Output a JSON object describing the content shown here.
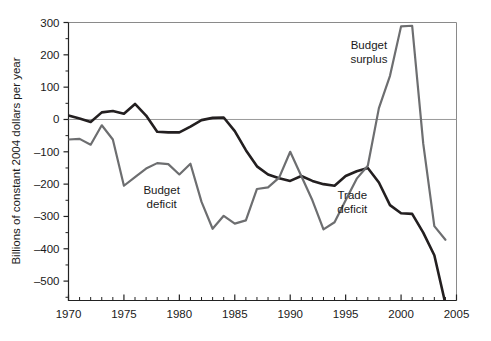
{
  "chart_data": {
    "type": "line",
    "title": "",
    "xlabel": "",
    "ylabel": "Billions of constant 2004 dollars per year",
    "xlim": [
      1970,
      2005
    ],
    "ylim": [
      -560,
      300
    ],
    "grid": false,
    "zero_line": true,
    "legend_position": "inline-annotations",
    "x_ticks_major": [
      1970,
      1975,
      1980,
      1985,
      1990,
      1995,
      2000,
      2005
    ],
    "x_tick_labels": [
      "1970",
      "1975",
      "1980",
      "1985",
      "1990",
      "1995",
      "2000",
      "2005"
    ],
    "x_minor_tick_interval": 1,
    "y_ticks_major": [
      300,
      200,
      100,
      0,
      -100,
      -200,
      -300,
      -400,
      -500
    ],
    "y_tick_labels": [
      "300",
      "200",
      "100",
      "0",
      "-100",
      "-200",
      "-300",
      "-400",
      "-500"
    ],
    "y_minor_tick_interval": 50,
    "annotations": [
      {
        "text_line1": "Budget",
        "text_line2": "surplus",
        "x": 1997.1,
        "y": 218
      },
      {
        "text_line1": "Budget",
        "text_line2": "deficit",
        "x": 1978.4,
        "y": -231
      },
      {
        "text_line1": "Trade",
        "text_line2": "deficit",
        "x": 1995.6,
        "y": -246
      }
    ],
    "series": [
      {
        "name": "Trade deficit",
        "color": "#231f20",
        "x": [
          1970,
          1971,
          1972,
          1973,
          1974,
          1975,
          1976,
          1977,
          1978,
          1979,
          1980,
          1981,
          1982,
          1983,
          1984,
          1985,
          1986,
          1987,
          1988,
          1989,
          1990,
          1991,
          1992,
          1993,
          1994,
          1995,
          1996,
          1997,
          1998,
          1999,
          2000,
          2001,
          2002,
          2003,
          2004
        ],
        "values": [
          12,
          3,
          -8,
          22,
          26,
          18,
          48,
          12,
          -38,
          -40,
          -40,
          -22,
          -2,
          5,
          6,
          -36,
          -95,
          -145,
          -170,
          -182,
          -190,
          -175,
          -190,
          -200,
          -205,
          -175,
          -160,
          -150,
          -195,
          -265,
          -290,
          -292,
          -350,
          -420,
          -570
        ]
      },
      {
        "name": "Budget",
        "color": "#6d6e70",
        "x": [
          1970,
          1971,
          1972,
          1973,
          1974,
          1975,
          1976,
          1977,
          1978,
          1979,
          1980,
          1981,
          1982,
          1983,
          1984,
          1985,
          1986,
          1987,
          1988,
          1989,
          1990,
          1991,
          1992,
          1993,
          1994,
          1995,
          1996,
          1997,
          1998,
          1999,
          2000,
          2001,
          2002,
          2003,
          2004
        ],
        "values": [
          -62,
          -60,
          -78,
          -18,
          -62,
          -205,
          -178,
          -152,
          -135,
          -138,
          -170,
          -137,
          -255,
          -338,
          -298,
          -322,
          -312,
          -215,
          -210,
          -180,
          -100,
          -175,
          -250,
          -340,
          -318,
          -250,
          -183,
          -143,
          35,
          135,
          288,
          290,
          -75,
          -330,
          -372
        ]
      }
    ]
  },
  "axis": {
    "y_title": "Billions of constant 2004 dollars per year"
  }
}
